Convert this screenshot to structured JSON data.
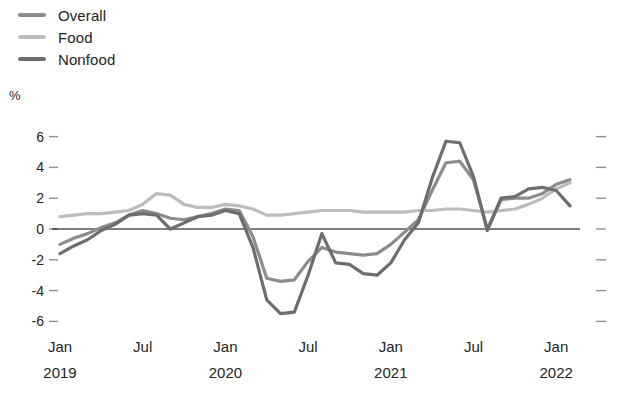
{
  "legend": {
    "position": "top-left",
    "items": [
      {
        "label": "Overall",
        "color": "#8c8c8c",
        "icon": "line-swatch-icon"
      },
      {
        "label": "Food",
        "color": "#bcbcbc",
        "icon": "line-swatch-icon"
      },
      {
        "label": "Nonfood",
        "color": "#6d6d6d",
        "icon": "line-swatch-icon"
      }
    ]
  },
  "axes": {
    "unit_label": "%",
    "y_ticks": [
      "6",
      "4",
      "2",
      "0",
      "-2",
      "-4",
      "-6"
    ],
    "x_ticks": [
      {
        "month": "Jan",
        "year": "2019"
      },
      {
        "month": "Jul",
        "year": ""
      },
      {
        "month": "Jan",
        "year": "2020"
      },
      {
        "month": "Jul",
        "year": ""
      },
      {
        "month": "Jan",
        "year": "2021"
      },
      {
        "month": "Jul",
        "year": ""
      },
      {
        "month": "Jan",
        "year": "2022"
      }
    ]
  },
  "chart_data": {
    "type": "line",
    "title": "",
    "subtitle": "",
    "xlabel": "",
    "ylabel": "%",
    "ylim": [
      -7.0,
      7.0
    ],
    "grid": false,
    "legend_position": "top-left",
    "zero_line": true,
    "x": [
      "Jan 2019",
      "Feb 2019",
      "Mar 2019",
      "Apr 2019",
      "May 2019",
      "Jun 2019",
      "Jul 2019",
      "Aug 2019",
      "Sep 2019",
      "Oct 2019",
      "Nov 2019",
      "Dec 2019",
      "Jan 2020",
      "Feb 2020",
      "Mar 2020",
      "Apr 2020",
      "May 2020",
      "Jun 2020",
      "Jul 2020",
      "Aug 2020",
      "Sep 2020",
      "Oct 2020",
      "Nov 2020",
      "Dec 2020",
      "Jan 2021",
      "Feb 2021",
      "Mar 2021",
      "Apr 2021",
      "May 2021",
      "Jun 2021",
      "Jul 2021",
      "Aug 2021",
      "Sep 2021",
      "Oct 2021",
      "Nov 2021",
      "Dec 2021",
      "Jan 2022",
      "Feb 2022"
    ],
    "series": [
      {
        "name": "Overall",
        "color": "#8c8c8c",
        "values": [
          -1.0,
          -0.6,
          -0.3,
          0.1,
          0.4,
          0.9,
          1.2,
          1.0,
          0.7,
          0.6,
          0.8,
          1.0,
          1.3,
          1.2,
          -0.5,
          -3.2,
          -3.4,
          -3.3,
          -2.1,
          -1.2,
          -1.5,
          -1.6,
          -1.7,
          -1.6,
          -1.0,
          -0.2,
          0.6,
          2.5,
          4.3,
          4.4,
          3.2,
          0.0,
          1.9,
          2.0,
          2.0,
          2.3,
          2.9,
          3.2
        ]
      },
      {
        "name": "Food",
        "color": "#bcbcbc",
        "values": [
          0.8,
          0.9,
          1.0,
          1.0,
          1.1,
          1.2,
          1.6,
          2.3,
          2.2,
          1.6,
          1.4,
          1.4,
          1.6,
          1.5,
          1.3,
          0.9,
          0.9,
          1.0,
          1.1,
          1.2,
          1.2,
          1.2,
          1.1,
          1.1,
          1.1,
          1.1,
          1.2,
          1.2,
          1.3,
          1.3,
          1.2,
          1.1,
          1.2,
          1.3,
          1.6,
          2.0,
          2.6,
          3.0
        ]
      },
      {
        "name": "Nonfood",
        "color": "#6d6d6d",
        "values": [
          -1.6,
          -1.1,
          -0.7,
          -0.1,
          0.3,
          0.9,
          1.0,
          0.9,
          0.0,
          0.4,
          0.8,
          0.9,
          1.2,
          1.0,
          -1.2,
          -4.6,
          -5.5,
          -5.4,
          -3.0,
          -0.3,
          -2.2,
          -2.3,
          -2.9,
          -3.0,
          -2.2,
          -0.7,
          0.4,
          3.3,
          5.7,
          5.6,
          3.4,
          -0.1,
          2.0,
          2.1,
          2.6,
          2.7,
          2.5,
          1.5
        ]
      }
    ]
  }
}
